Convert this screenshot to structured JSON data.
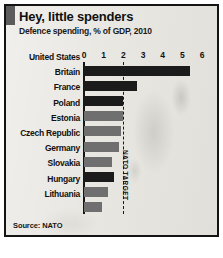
{
  "card": {
    "title": "Hey, little spenders",
    "subtitle": "Defence spending, % of GDP, 2010",
    "source": "Source: NATO",
    "accent_color": "#5c5c5c",
    "background_color": "#e9e7e2",
    "border_color": "#141414"
  },
  "annotation": {
    "nato_target_label": "NATO TARGET",
    "nato_target_value": 2
  },
  "chart_data": {
    "type": "bar",
    "orientation": "horizontal",
    "title": "Hey, little spenders",
    "subtitle": "Defence spending, % of GDP, 2010",
    "xlabel": "",
    "ylabel": "",
    "xlim": [
      0,
      6
    ],
    "xticks": [
      0,
      1,
      2,
      3,
      4,
      5,
      6
    ],
    "xtick_labels": [
      "0",
      "1",
      "2",
      "3",
      "4",
      "5",
      "6"
    ],
    "grid": false,
    "legend": "none",
    "source": "Source: NATO",
    "categories": [
      "United States",
      "Britain",
      "France",
      "Poland",
      "Estonia",
      "Czech Republic",
      "Germany",
      "Slovakia",
      "Hungary",
      "Lithuania"
    ],
    "values": [
      5.4,
      2.7,
      2.0,
      2.0,
      1.9,
      1.8,
      1.4,
      1.5,
      1.2,
      0.9
    ],
    "bar_colors": [
      "#1b1b1b",
      "#1b1b1b",
      "#1b1b1b",
      "#6f6f6f",
      "#6f6f6f",
      "#6f6f6f",
      "#6f6f6f",
      "#1b1b1b",
      "#6f6f6f",
      "#6f6f6f"
    ],
    "annotations": [
      {
        "type": "vline",
        "value": 2,
        "label": "NATO TARGET",
        "style": "dashed"
      }
    ]
  }
}
